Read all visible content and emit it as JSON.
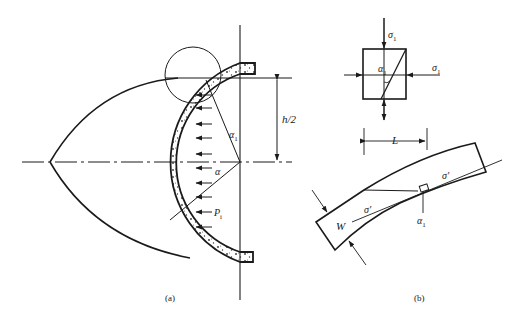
{
  "figure": {
    "panel_a": {
      "caption": "(a)",
      "labels": {
        "half_height": "h/2",
        "angle_alpha1": "α",
        "angle_alpha1_sub": "1",
        "angle_alpha": "α",
        "pressure": "P",
        "pressure_sub": "i"
      },
      "pressure_arrows": 11
    },
    "panel_b": {
      "caption": "(b)",
      "labels": {
        "sigma1_top": "σ",
        "sigma1_top_sub": "1",
        "sigma1_right": "σ",
        "sigma1_right_sub": "1",
        "alpha1_box": "α",
        "alpha1_box_sub": "1",
        "length": "L",
        "width": "W",
        "sigma_prime_upper": "σ'",
        "sigma_prime_lower": "σ'",
        "alpha1_beam": "α",
        "alpha1_beam_sub": "1"
      }
    },
    "colors": {
      "ink": "#1a1a1a",
      "background": "#ffffff"
    }
  }
}
